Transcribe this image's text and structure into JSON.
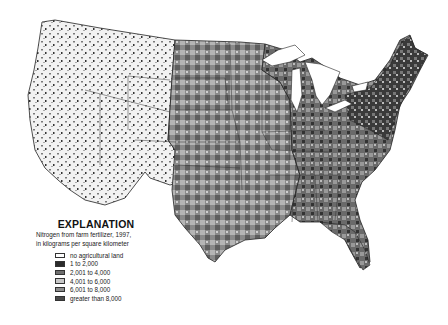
{
  "map": {
    "subject": "Nitrogen from farm fertilizer, United States, 1997",
    "region": "Conterminous United States"
  },
  "legend": {
    "title": "EXPLANATION",
    "subtitle_line1": "Nitrogen from farm fertilizer, 1997,",
    "subtitle_line2": "in kilograms per square kilometer",
    "items": [
      {
        "label": "no agricultural land",
        "color": "#ffffff"
      },
      {
        "label": "1 to 2,000",
        "color": "#2b2b2b"
      },
      {
        "label": "2,001 to 4,000",
        "color": "#6e6e6e"
      },
      {
        "label": "4,001 to 6,000",
        "color": "#c8c8c8"
      },
      {
        "label": "6,001 to 8,000",
        "color": "#8e8e8e"
      },
      {
        "label": "greater than 8,000",
        "color": "#4a4a4a"
      }
    ]
  }
}
